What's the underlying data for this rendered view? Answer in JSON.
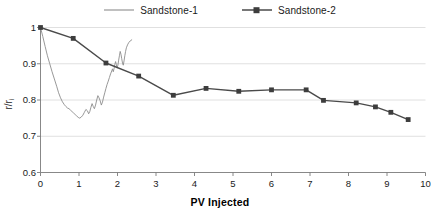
{
  "chart_data": {
    "type": "line",
    "title": "",
    "xlabel": "PV Injected",
    "ylabel": "r/r",
    "ylabel_sub": "i",
    "xlim": [
      0,
      10
    ],
    "ylim": [
      0.6,
      1.0
    ],
    "xticks": [
      0,
      1,
      2,
      3,
      4,
      5,
      6,
      7,
      8,
      9,
      10
    ],
    "xtick_labels": [
      "0",
      "1",
      "2",
      "3",
      "4",
      "5",
      "6",
      "7",
      "8",
      "9",
      "10"
    ],
    "yticks": [
      0.6,
      0.7,
      0.8,
      0.9,
      1.0
    ],
    "ytick_labels": [
      "0.6",
      "0.7",
      "0.8",
      "0.9",
      "1"
    ],
    "grid": "horizontal",
    "legend_position": "top-center",
    "series": [
      {
        "name": "Sandstone-1",
        "color": "#8c8c8c",
        "marker": "none",
        "line_width": 0.9,
        "points": [
          [
            0.0,
            1.0
          ],
          [
            0.06,
            0.975
          ],
          [
            0.12,
            0.948
          ],
          [
            0.18,
            0.922
          ],
          [
            0.24,
            0.9
          ],
          [
            0.3,
            0.878
          ],
          [
            0.36,
            0.858
          ],
          [
            0.42,
            0.838
          ],
          [
            0.47,
            0.82
          ],
          [
            0.52,
            0.806
          ],
          [
            0.57,
            0.795
          ],
          [
            0.62,
            0.787
          ],
          [
            0.66,
            0.782
          ],
          [
            0.7,
            0.778
          ],
          [
            0.74,
            0.776
          ],
          [
            0.78,
            0.772
          ],
          [
            0.82,
            0.768
          ],
          [
            0.86,
            0.764
          ],
          [
            0.9,
            0.76
          ],
          [
            0.94,
            0.756
          ],
          [
            0.98,
            0.752
          ],
          [
            1.02,
            0.75
          ],
          [
            1.06,
            0.753
          ],
          [
            1.1,
            0.758
          ],
          [
            1.14,
            0.766
          ],
          [
            1.18,
            0.774
          ],
          [
            1.22,
            0.77
          ],
          [
            1.25,
            0.762
          ],
          [
            1.28,
            0.768
          ],
          [
            1.31,
            0.78
          ],
          [
            1.34,
            0.79
          ],
          [
            1.37,
            0.782
          ],
          [
            1.4,
            0.776
          ],
          [
            1.43,
            0.786
          ],
          [
            1.46,
            0.8
          ],
          [
            1.49,
            0.812
          ],
          [
            1.52,
            0.806
          ],
          [
            1.55,
            0.798
          ],
          [
            1.58,
            0.786
          ],
          [
            1.61,
            0.794
          ],
          [
            1.64,
            0.808
          ],
          [
            1.67,
            0.82
          ],
          [
            1.7,
            0.832
          ],
          [
            1.73,
            0.843
          ],
          [
            1.76,
            0.852
          ],
          [
            1.79,
            0.862
          ],
          [
            1.82,
            0.872
          ],
          [
            1.85,
            0.88
          ],
          [
            1.87,
            0.886
          ],
          [
            1.89,
            0.878
          ],
          [
            1.91,
            0.886
          ],
          [
            1.93,
            0.898
          ],
          [
            1.95,
            0.906
          ],
          [
            1.97,
            0.898
          ],
          [
            1.99,
            0.888
          ],
          [
            2.01,
            0.896
          ],
          [
            2.03,
            0.91
          ],
          [
            2.05,
            0.922
          ],
          [
            2.07,
            0.934
          ],
          [
            2.09,
            0.926
          ],
          [
            2.11,
            0.914
          ],
          [
            2.13,
            0.902
          ],
          [
            2.15,
            0.896
          ],
          [
            2.17,
            0.908
          ],
          [
            2.19,
            0.922
          ],
          [
            2.21,
            0.934
          ],
          [
            2.23,
            0.944
          ],
          [
            2.26,
            0.952
          ],
          [
            2.29,
            0.958
          ],
          [
            2.33,
            0.963
          ],
          [
            2.37,
            0.966
          ]
        ]
      },
      {
        "name": "Sandstone-2",
        "color": "#4a4a4a",
        "marker": "square",
        "line_width": 1.4,
        "points": [
          [
            0.0,
            1.0
          ],
          [
            0.85,
            0.97
          ],
          [
            1.7,
            0.902
          ],
          [
            2.55,
            0.866
          ],
          [
            3.45,
            0.813
          ],
          [
            4.3,
            0.832
          ],
          [
            5.15,
            0.824
          ],
          [
            6.0,
            0.828
          ],
          [
            6.9,
            0.828
          ],
          [
            7.35,
            0.799
          ],
          [
            8.2,
            0.792
          ],
          [
            8.7,
            0.781
          ],
          [
            9.1,
            0.766
          ],
          [
            9.55,
            0.746
          ]
        ]
      }
    ]
  }
}
